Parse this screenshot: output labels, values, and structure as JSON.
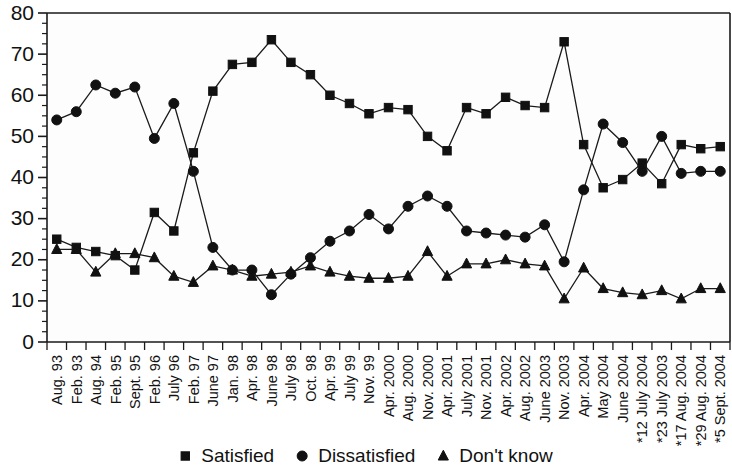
{
  "chart_data": {
    "type": "line",
    "title": "",
    "subtitle": "",
    "xlabel": "",
    "ylabel": "",
    "ylim": [
      0,
      80
    ],
    "ytick_step": 10,
    "yminor_step": 2.5,
    "grid": false,
    "legend_position": "bottom-center",
    "categories": [
      "Aug. 93",
      "Feb. 93",
      "Aug. 94",
      "Feb. 95",
      "Sept. 95",
      "Feb. 96",
      "July 96",
      "Feb. 97",
      "June 97",
      "Jan. 98",
      "Apr. 98",
      "June 98",
      "July 98",
      "Oct. 98",
      "Apr. 99",
      "July 99",
      "Nov. 99",
      "Apr. 2000",
      "Aug. 2000",
      "Nov. 2000",
      "Apr. 2001",
      "July 2001",
      "Nov. 2001",
      "Apr. 2002",
      "Aug. 2002",
      "June 2003",
      "Nov. 2003",
      "Apr. 2004",
      "May 2004",
      "June 2004",
      "*12 July 2004",
      "*23 July 2003",
      "*17 Aug. 2004",
      "*29 Aug. 2004",
      "*5 Sept. 2004"
    ],
    "yticks": [
      0,
      10,
      20,
      30,
      40,
      50,
      60,
      70,
      80
    ],
    "series": [
      {
        "name": "Satisfied",
        "marker": "square",
        "color": "#111111",
        "values": [
          25,
          23,
          22,
          21,
          17.5,
          31.5,
          27,
          46,
          61,
          67.5,
          68,
          73.5,
          68,
          65,
          60,
          58,
          55.5,
          57,
          56.5,
          50,
          46.5,
          57,
          55.5,
          59.5,
          57.5,
          57,
          73,
          48,
          37.5,
          39.5,
          43.5,
          38.5,
          48,
          47,
          47.5
        ]
      },
      {
        "name": "Dissatisfied",
        "marker": "circle",
        "color": "#111111",
        "values": [
          54,
          56,
          62.5,
          60.5,
          62,
          49.5,
          58,
          41.5,
          23,
          17.5,
          17.5,
          11.5,
          16.5,
          20.5,
          24.5,
          27,
          31,
          27.5,
          33,
          35.5,
          33,
          27,
          26.5,
          26,
          25.5,
          28.5,
          19.5,
          37,
          53,
          48.5,
          41.5,
          50,
          41,
          41.5,
          41.5
        ]
      },
      {
        "name": "Don't know",
        "marker": "triangle",
        "color": "#111111",
        "values": [
          22.5,
          22.5,
          17,
          21.5,
          21.5,
          20.5,
          16,
          14.5,
          18.5,
          17.5,
          16,
          16.5,
          17,
          18.5,
          17,
          16,
          15.5,
          15.5,
          16,
          22,
          16,
          19,
          19,
          20,
          19,
          18.5,
          10.5,
          18,
          13,
          12,
          11.5,
          12.5,
          10.5,
          13,
          13
        ]
      }
    ]
  },
  "legend": {
    "entries": [
      {
        "label": "Satisfied",
        "marker": "square-marker"
      },
      {
        "label": "Dissatisfied",
        "marker": "circle-marker"
      },
      {
        "label": "Don't know",
        "marker": "triangle-marker"
      }
    ]
  },
  "axis": {
    "y_max_label": "80",
    "y_min_label": "0"
  }
}
